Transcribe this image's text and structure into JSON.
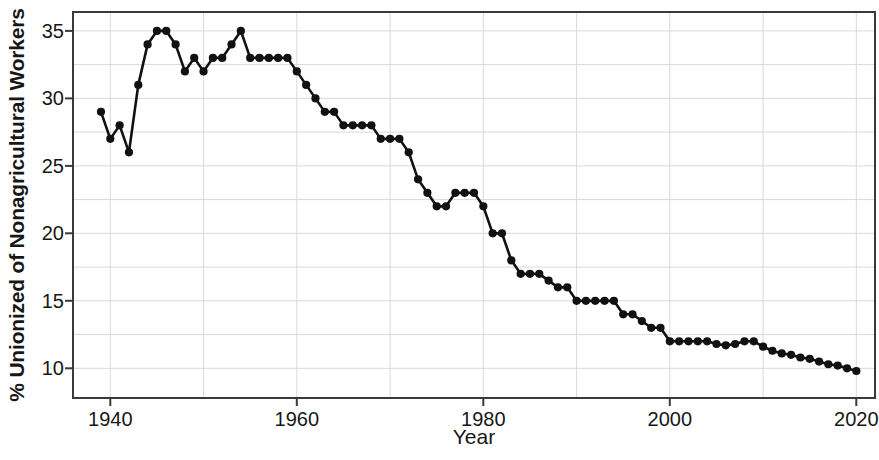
{
  "chart_data": {
    "type": "line",
    "title": "",
    "xlabel": "Year",
    "ylabel": "% Unionized of Nonagricultural Workers",
    "xlim": [
      1936,
      1022
    ],
    "x_range": [
      1936,
      2022
    ],
    "ylim": [
      7.8,
      36.4
    ],
    "grid": true,
    "legend": false,
    "marker": "filled-circle",
    "line_color": "#111111",
    "marker_color": "#111111",
    "grid_color": "#d9d9d9",
    "axis_color": "#3a3a3a",
    "background": "#ffffff",
    "xticks": [
      1940,
      1960,
      1980,
      2000,
      2020
    ],
    "xtick_labels": [
      "1940",
      "1960",
      "1980",
      "2000",
      "2020"
    ],
    "yticks": [
      10,
      15,
      20,
      25,
      30,
      35
    ],
    "ytick_labels": [
      "10",
      "15",
      "20",
      "25",
      "30",
      "35"
    ],
    "y_minor_ticks": [
      12.5,
      17.5,
      22.5,
      27.5,
      32.5
    ],
    "x_minor_ticks": [
      1950,
      1970,
      1990,
      2010
    ],
    "series": [
      {
        "name": "% Unionized of Nonagricultural Workers",
        "x": [
          1939,
          1940,
          1941,
          1942,
          1943,
          1944,
          1945,
          1946,
          1947,
          1948,
          1949,
          1950,
          1951,
          1952,
          1953,
          1954,
          1955,
          1956,
          1957,
          1958,
          1959,
          1960,
          1961,
          1962,
          1963,
          1964,
          1965,
          1966,
          1967,
          1968,
          1969,
          1970,
          1971,
          1972,
          1973,
          1974,
          1975,
          1976,
          1977,
          1978,
          1979,
          1980,
          1981,
          1982,
          1983,
          1984,
          1985,
          1986,
          1987,
          1988,
          1989,
          1990,
          1991,
          1992,
          1993,
          1994,
          1995,
          1996,
          1997,
          1998,
          1999,
          2000,
          2001,
          2002,
          2003,
          2004,
          2005,
          2006,
          2007,
          2008,
          2009,
          2010,
          2011,
          2012,
          2013,
          2014,
          2015,
          2016,
          2017,
          2018,
          2019,
          2020
        ],
        "values": [
          29,
          27,
          28,
          26,
          31,
          34,
          35,
          35,
          34,
          32,
          33,
          32,
          33,
          33,
          34,
          35,
          33,
          33,
          33,
          33,
          33,
          32,
          31,
          30,
          29,
          29,
          28,
          28,
          28,
          28,
          27,
          27,
          27,
          26,
          24,
          23,
          22,
          22,
          23,
          23,
          23,
          22,
          20,
          20,
          18,
          17,
          17,
          17,
          16.5,
          16,
          16,
          15,
          15,
          15,
          15,
          15,
          14,
          14,
          13.5,
          13,
          13,
          12,
          12,
          12,
          12,
          12,
          11.8,
          11.7,
          11.8,
          12,
          12,
          11.6,
          11.3,
          11.1,
          11,
          10.8,
          10.7,
          10.5,
          10.3,
          10.2,
          10,
          9.8
        ]
      }
    ]
  },
  "axes": {
    "ylabel_text": "% Unionized of Nonagricultural Workers",
    "xlabel_text": "Year"
  }
}
